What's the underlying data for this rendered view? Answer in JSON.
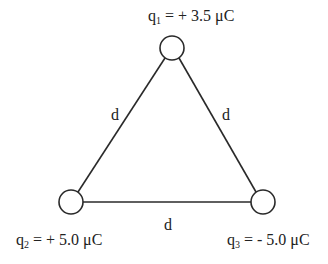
{
  "diagram": {
    "type": "charge-triangle",
    "colors": {
      "stroke": "#2a2a2a",
      "text": "#222222",
      "background": "#ffffff"
    },
    "charges": [
      {
        "id": "q1",
        "symbol": "q",
        "subscript": "1",
        "rest": " = + 3.5 μC",
        "value": "+3.5",
        "unit": "μC",
        "position": "top"
      },
      {
        "id": "q2",
        "symbol": "q",
        "subscript": "2",
        "rest": " = + 5.0 μC",
        "value": "+5.0",
        "unit": "μC",
        "position": "bottom-left"
      },
      {
        "id": "q3",
        "symbol": "q",
        "subscript": "3",
        "rest": " = - 5.0 μC",
        "value": "-5.0",
        "unit": "μC",
        "position": "bottom-right"
      }
    ],
    "sides": [
      {
        "id": "left",
        "label": "d",
        "from": "q1",
        "to": "q2"
      },
      {
        "id": "right",
        "label": "d",
        "from": "q1",
        "to": "q3"
      },
      {
        "id": "bottom",
        "label": "d",
        "from": "q2",
        "to": "q3"
      }
    ]
  }
}
